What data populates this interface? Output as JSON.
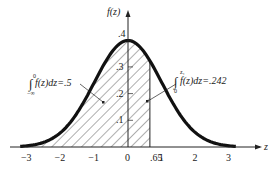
{
  "chart_data": {
    "type": "area",
    "title": "",
    "xlabel": "z",
    "ylabel": "f(z)",
    "function": "standard normal density",
    "x_ticks": [
      "-3",
      "-2",
      "-1",
      "0",
      ".65",
      "1",
      "2",
      "3"
    ],
    "x_tick_values": [
      -3,
      -2,
      -1,
      0,
      0.65,
      1,
      2,
      3
    ],
    "y_ticks": [
      ".1",
      ".2",
      ".3",
      ".4"
    ],
    "y_tick_values": [
      0.1,
      0.2,
      0.3,
      0.4
    ],
    "xlim": [
      -3.2,
      3.2
    ],
    "ylim": [
      0,
      0.45
    ],
    "grid": false,
    "shaded_regions": [
      {
        "from": "-inf",
        "to": 0,
        "area": 0.5,
        "label": "∫f(z)dz=.5",
        "lower": "−∞",
        "upper": "0"
      },
      {
        "from": 0,
        "to": 0.65,
        "area": 0.242,
        "label": "∫f(z)dz=.242",
        "lower": "0",
        "upper": "z₁"
      }
    ],
    "annotations": [
      {
        "text": "∫f(z)dz=.5",
        "lower_limit": "−∞",
        "upper_limit": "0"
      },
      {
        "text": "∫f(z)dz=.242",
        "lower_limit": "0",
        "upper_limit": "z₁"
      }
    ]
  },
  "labels": {
    "y_axis": "f(z)",
    "x_axis": "z",
    "ann1_text": "f(z)dz=.5",
    "ann1_upper": "0",
    "ann1_lower": "−∞",
    "ann2_text": "f(z)dz=.242",
    "ann2_upper": "z₁",
    "ann2_lower": "0",
    "x_ticks": [
      "−3",
      "−2",
      "−1",
      "0",
      ".65",
      "1",
      "2",
      "3"
    ],
    "y_ticks": [
      ".1",
      ".2",
      ".3",
      ".4"
    ]
  }
}
